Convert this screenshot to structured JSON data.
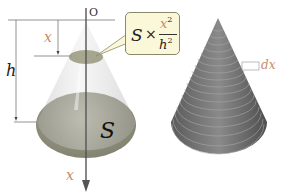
{
  "diagram": {
    "left_figure": {
      "origin_label": "O",
      "height_label": "h",
      "depth_label": "x",
      "axis_label": "x",
      "base_area_label": "S",
      "callout": {
        "coefficient": "S",
        "operator": "×",
        "numerator": "x",
        "numerator_exp": "2",
        "denominator": "h",
        "denominator_exp": "2"
      }
    },
    "right_figure": {
      "slice_thickness_label": "dx",
      "slice_count": 22
    },
    "colors": {
      "cone_fill": "#c9c9c9",
      "cross_section_fill": "#8c8c6c",
      "base_fill": "#8f8f7a",
      "callout_fill": "#fbf8d9",
      "variable_x_color": "#c88a6a",
      "axis_color": "#555555",
      "stacked_cone_color": "#6e6e6e"
    }
  }
}
